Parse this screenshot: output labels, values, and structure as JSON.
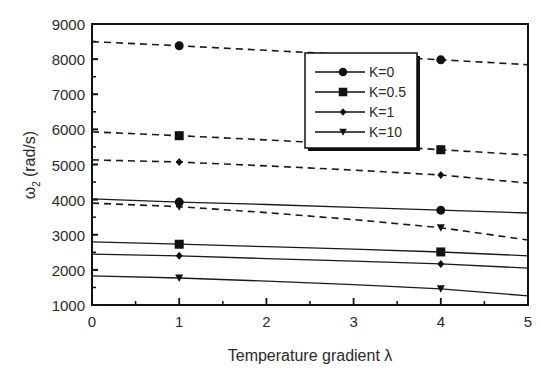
{
  "chart_data": {
    "type": "line",
    "title": "",
    "xlabel": "Temperature gradient λ",
    "ylabel_symbol": "ω",
    "ylabel_subscript": "2",
    "ylabel_unit": "(rad/s)",
    "xlim": [
      0,
      5
    ],
    "ylim": [
      1000,
      9000
    ],
    "x_ticks": [
      "0",
      "1",
      "2",
      "3",
      "4",
      "5"
    ],
    "y_ticks": [
      "1000",
      "2000",
      "3000",
      "4000",
      "5000",
      "6000",
      "7000",
      "8000",
      "9000"
    ],
    "grid": false,
    "legend_position": "upper right (inset)",
    "legend": [
      {
        "label": "K=0",
        "marker": "circle"
      },
      {
        "label": "K=0.5",
        "marker": "square"
      },
      {
        "label": "K=1",
        "marker": "diamond"
      },
      {
        "label": "K=10",
        "marker": "triangle-down"
      }
    ],
    "marker_x": [
      1,
      4
    ],
    "x": [
      0,
      1,
      2,
      3,
      4,
      5
    ],
    "series": [
      {
        "name": "K=0 (dashed)",
        "style": "dashed",
        "marker": "circle",
        "values": [
          8500,
          8380,
          8250,
          8120,
          7980,
          7840
        ]
      },
      {
        "name": "K=0.5 (dashed)",
        "style": "dashed",
        "marker": "square",
        "values": [
          5930,
          5820,
          5700,
          5570,
          5420,
          5270
        ]
      },
      {
        "name": "K=1 (dashed)",
        "style": "dashed",
        "marker": "diamond",
        "values": [
          5130,
          5070,
          4960,
          4840,
          4700,
          4470
        ]
      },
      {
        "name": "K=10 (dashed)",
        "style": "dashed",
        "marker": "triangle-down",
        "values": [
          3900,
          3800,
          3630,
          3430,
          3200,
          2850
        ]
      },
      {
        "name": "K=0 (solid)",
        "style": "solid",
        "marker": "circle",
        "values": [
          4020,
          3930,
          3860,
          3780,
          3700,
          3620
        ]
      },
      {
        "name": "K=0.5 (solid)",
        "style": "solid",
        "marker": "square",
        "values": [
          2800,
          2730,
          2660,
          2590,
          2510,
          2400
        ]
      },
      {
        "name": "K=1 (solid)",
        "style": "solid",
        "marker": "diamond",
        "values": [
          2450,
          2400,
          2320,
          2250,
          2170,
          2050
        ]
      },
      {
        "name": "K=10 (solid)",
        "style": "solid",
        "marker": "triangle-down",
        "values": [
          1830,
          1770,
          1680,
          1580,
          1460,
          1260
        ]
      }
    ]
  }
}
